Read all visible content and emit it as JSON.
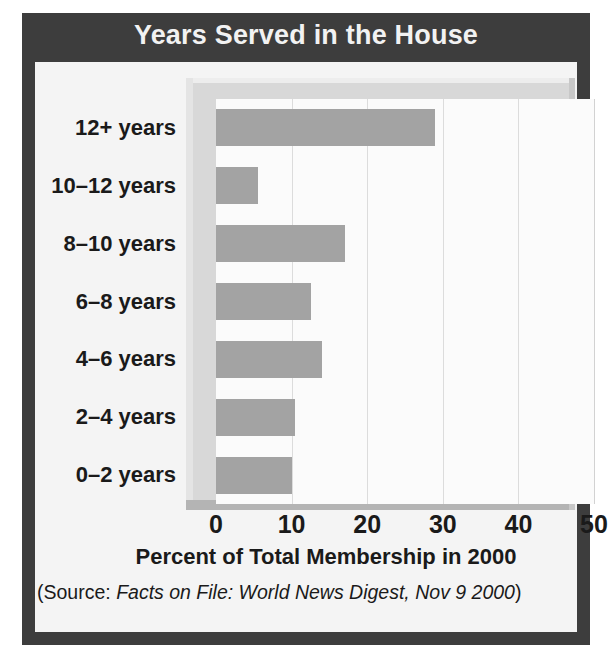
{
  "figure": {
    "title": "Years Served in the House",
    "source_prefix": "(Source: ",
    "source_italic": "Facts on File: World News Digest, Nov 9 2000",
    "source_suffix": ")",
    "banner_color": "#3d3d3d",
    "bar_color": "#a3a3a3",
    "panel_color": "#f4f4f4"
  },
  "chart_data": {
    "type": "bar",
    "orientation": "horizontal",
    "title": "Years Served in the House",
    "xlabel": "Percent of Total Membership in 2000",
    "ylabel": "",
    "categories": [
      "0–2 years",
      "2–4 years",
      "4–6 years",
      "6–8 years",
      "8–10 years",
      "10–12 years",
      "12+ years"
    ],
    "values": [
      10,
      10.5,
      14,
      12.5,
      17,
      5.5,
      29
    ],
    "xlim": [
      0,
      50
    ],
    "xticks": [
      0,
      10,
      20,
      30,
      40,
      50
    ],
    "xtick_labels": [
      "0",
      "10",
      "20",
      "30",
      "40",
      "50"
    ],
    "grid": "vertical",
    "legend": "none",
    "series": [
      {
        "name": "Percent of Total Membership in 2000",
        "values": [
          10,
          10.5,
          14,
          12.5,
          17,
          5.5,
          29
        ]
      }
    ]
  }
}
